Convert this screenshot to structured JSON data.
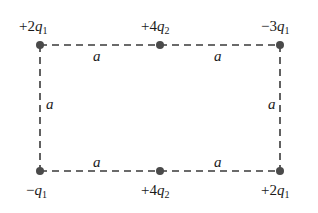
{
  "diagram": {
    "type": "charge-configuration",
    "shape": "rectangle",
    "line_style": "dashed",
    "charges": [
      {
        "id": "top-left",
        "sign": "+",
        "coef": "2",
        "var": "q",
        "sub": "1"
      },
      {
        "id": "top-middle",
        "sign": "+",
        "coef": "4",
        "var": "q",
        "sub": "2"
      },
      {
        "id": "top-right",
        "sign": "−",
        "coef": "3",
        "var": "q",
        "sub": "1"
      },
      {
        "id": "bottom-left",
        "sign": "−",
        "coef": "",
        "var": "q",
        "sub": "1"
      },
      {
        "id": "bottom-middle",
        "sign": "+",
        "coef": "4",
        "var": "q",
        "sub": "2"
      },
      {
        "id": "bottom-right",
        "sign": "+",
        "coef": "2",
        "var": "q",
        "sub": "1"
      }
    ],
    "segment_labels": {
      "top_left": "a",
      "top_right": "a",
      "left": "a",
      "right": "a",
      "bottom_left": "a",
      "bottom_right": "a"
    },
    "colors": {
      "line": "#3a3a3a",
      "dot": "#4a4a4a",
      "text": "#1a1a1a"
    }
  }
}
